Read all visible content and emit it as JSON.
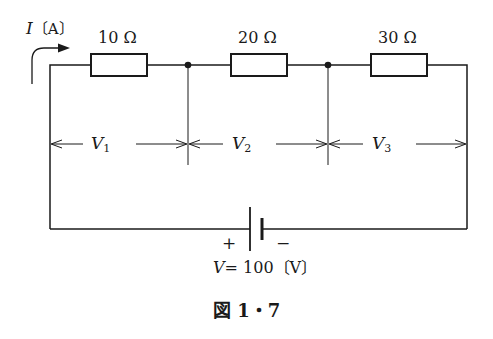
{
  "figure": {
    "caption": "図 1・7",
    "current_label": {
      "symbol": "I",
      "unit": "〔A〕"
    },
    "resistors": [
      {
        "label": "10 Ω",
        "value_ohm": 10
      },
      {
        "label": "20 Ω",
        "value_ohm": 20
      },
      {
        "label": "30 Ω",
        "value_ohm": 30
      }
    ],
    "voltage_drops": [
      {
        "symbol": "V",
        "sub": "1"
      },
      {
        "symbol": "V",
        "sub": "2"
      },
      {
        "symbol": "V",
        "sub": "3"
      }
    ],
    "source": {
      "plus": "+",
      "minus": "−",
      "symbol": "V",
      "equation": "= 100〔V〕",
      "value_volt": 100
    },
    "colors": {
      "line": "#1a1a1a",
      "background": "#ffffff"
    }
  }
}
